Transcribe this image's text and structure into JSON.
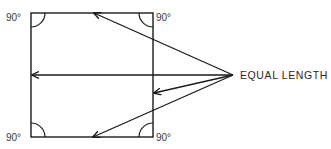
{
  "diagram": {
    "square": {
      "x1": 31,
      "y1": 13,
      "x2": 153,
      "y2": 137
    },
    "corner_angle_labels": [
      {
        "position": "top-left",
        "text": "90°"
      },
      {
        "position": "top-right",
        "text": "90°"
      },
      {
        "position": "bottom-left",
        "text": "90°"
      },
      {
        "position": "bottom-right",
        "text": "90°"
      }
    ],
    "annotation": {
      "text": "EQUAL LENGTH",
      "origin": {
        "x": 233,
        "y": 75
      }
    },
    "arrows": [
      {
        "name": "arrow-to-top-edge",
        "to": {
          "x": 94,
          "y": 13
        }
      },
      {
        "name": "arrow-to-left-edge",
        "to": {
          "x": 32,
          "y": 75
        }
      },
      {
        "name": "arrow-to-right-edge",
        "to": {
          "x": 153,
          "y": 93
        }
      },
      {
        "name": "arrow-to-bottom-edge",
        "to": {
          "x": 93,
          "y": 137
        }
      }
    ],
    "colors": {
      "line": "#1a1a1a",
      "text": "#333333",
      "background": "#ffffff"
    }
  }
}
